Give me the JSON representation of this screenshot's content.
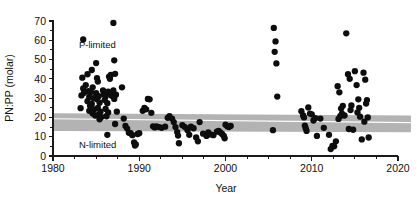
{
  "chart_data": {
    "type": "scatter",
    "title": "",
    "xlabel": "Year",
    "ylabel": "PN:PP (molar)",
    "xlim": [
      1980,
      2020
    ],
    "ylim": [
      0,
      70
    ],
    "xticks": [
      1980,
      1990,
      2000,
      2010,
      2020
    ],
    "yticks": [
      0,
      10,
      20,
      30,
      40,
      50,
      60,
      70
    ],
    "xtick_labels": [
      "1980",
      "1990",
      "2000",
      "2010",
      "2020"
    ],
    "ytick_labels": [
      "0",
      "10",
      "20",
      "30",
      "40",
      "50",
      "60",
      "70"
    ],
    "x_minor_interval": 2.5,
    "y_minor_interval": 5,
    "grid": false,
    "legend": "none",
    "annotations": [
      {
        "text": "P-limited",
        "x": 1983.0,
        "y": 56.0,
        "name": "p-limited-label"
      },
      {
        "text": "N-limited",
        "x": 1983.0,
        "y": 4.0,
        "name": "n-limited-label"
      }
    ],
    "trend_band": {
      "name": "redfield-confidence-band",
      "color": "#b3b3b3",
      "line_color": "#ffffff",
      "x_start": 1980.0,
      "x_end": 2021.5,
      "upper_start": 22.2,
      "upper_end": 21.0,
      "lower_start": 12.9,
      "lower_end": 12.3,
      "line_start": 19.3,
      "line_end": 17.3
    },
    "series": [
      {
        "name": "PN:PP observations",
        "marker": "filled-circle",
        "color": "#0d0d0d",
        "marker_size": 4.3,
        "points": [
          [
            1983.5,
            60.4
          ],
          [
            1983.4,
            40.6
          ],
          [
            1983.5,
            35.0
          ],
          [
            1983.6,
            32.8
          ],
          [
            1983.3,
            31.4
          ],
          [
            1983.2,
            24.8
          ],
          [
            1983.8,
            36.8
          ],
          [
            1984.0,
            42.4
          ],
          [
            1984.1,
            33.6
          ],
          [
            1984.2,
            30.6
          ],
          [
            1984.0,
            28.4
          ],
          [
            1984.3,
            26.0
          ],
          [
            1984.2,
            23.4
          ],
          [
            1984.5,
            44.6
          ],
          [
            1984.6,
            35.6
          ],
          [
            1984.4,
            33.2
          ],
          [
            1984.7,
            30.0
          ],
          [
            1984.5,
            27.0
          ],
          [
            1984.8,
            24.2
          ],
          [
            1984.6,
            22.0
          ],
          [
            1984.9,
            21.0
          ],
          [
            1985.0,
            48.2
          ],
          [
            1985.1,
            40.4
          ],
          [
            1985.2,
            38.6
          ],
          [
            1985.0,
            32.6
          ],
          [
            1985.3,
            31.0
          ],
          [
            1985.1,
            29.4
          ],
          [
            1985.4,
            27.6
          ],
          [
            1985.2,
            25.0
          ],
          [
            1985.5,
            23.0
          ],
          [
            1985.3,
            21.4
          ],
          [
            1985.6,
            20.2
          ],
          [
            1985.4,
            19.0
          ],
          [
            1985.8,
            34.0
          ],
          [
            1985.9,
            32.2
          ],
          [
            1986.0,
            31.6
          ],
          [
            1986.1,
            30.8
          ],
          [
            1986.2,
            32.0
          ],
          [
            1986.0,
            29.0
          ],
          [
            1986.3,
            27.4
          ],
          [
            1986.1,
            24.4
          ],
          [
            1986.4,
            22.6
          ],
          [
            1986.2,
            20.6
          ],
          [
            1986.5,
            41.2
          ],
          [
            1986.6,
            40.0
          ],
          [
            1986.7,
            42.0
          ],
          [
            1986.4,
            33.4
          ],
          [
            1986.8,
            31.2
          ],
          [
            1986.3,
            11.0
          ],
          [
            1987.0,
            69.0
          ],
          [
            1987.1,
            49.6
          ],
          [
            1987.2,
            42.6
          ],
          [
            1987.0,
            34.0
          ],
          [
            1987.3,
            31.8
          ],
          [
            1987.1,
            29.6
          ],
          [
            1987.4,
            23.0
          ],
          [
            1987.2,
            16.6
          ],
          [
            1988.0,
            35.6
          ],
          [
            1988.2,
            19.4
          ],
          [
            1988.4,
            15.6
          ],
          [
            1988.6,
            14.2
          ],
          [
            1988.8,
            12.0
          ],
          [
            1989.0,
            11.8
          ],
          [
            1989.2,
            10.8
          ],
          [
            1989.4,
            7.0
          ],
          [
            1989.5,
            5.4
          ],
          [
            1989.6,
            6.0
          ],
          [
            1989.8,
            11.4
          ],
          [
            1990.0,
            11.8
          ],
          [
            1990.4,
            23.4
          ],
          [
            1990.6,
            25.0
          ],
          [
            1990.8,
            24.2
          ],
          [
            1991.0,
            29.6
          ],
          [
            1991.2,
            29.4
          ],
          [
            1991.4,
            22.4
          ],
          [
            1991.6,
            15.4
          ],
          [
            1991.8,
            14.8
          ],
          [
            1992.0,
            15.4
          ],
          [
            1992.3,
            15.0
          ],
          [
            1992.6,
            14.6
          ],
          [
            1993.0,
            15.2
          ],
          [
            1993.3,
            19.8
          ],
          [
            1993.5,
            20.6
          ],
          [
            1993.8,
            19.4
          ],
          [
            1994.0,
            17.6
          ],
          [
            1994.2,
            15.0
          ],
          [
            1994.4,
            12.4
          ],
          [
            1994.5,
            10.6
          ],
          [
            1994.6,
            6.6
          ],
          [
            1995.0,
            16.0
          ],
          [
            1995.3,
            15.0
          ],
          [
            1995.6,
            13.4
          ],
          [
            1995.8,
            11.0
          ],
          [
            1996.0,
            15.2
          ],
          [
            1996.3,
            14.4
          ],
          [
            1996.6,
            9.6
          ],
          [
            1996.8,
            7.6
          ],
          [
            1997.0,
            17.6
          ],
          [
            1997.4,
            11.6
          ],
          [
            1997.8,
            10.4
          ],
          [
            1998.0,
            12.2
          ],
          [
            1998.3,
            11.2
          ],
          [
            1998.6,
            10.8
          ],
          [
            1999.0,
            12.6
          ],
          [
            1999.2,
            13.0
          ],
          [
            1999.4,
            12.2
          ],
          [
            1999.6,
            11.4
          ],
          [
            1999.8,
            10.4
          ],
          [
            1999.9,
            9.2
          ],
          [
            2000.0,
            16.2
          ],
          [
            2000.2,
            15.4
          ],
          [
            2000.4,
            15.0
          ],
          [
            2000.6,
            15.6
          ],
          [
            2005.6,
            66.4
          ],
          [
            2005.8,
            59.4
          ],
          [
            2005.7,
            54.0
          ],
          [
            2005.9,
            48.0
          ],
          [
            2006.0,
            30.8
          ],
          [
            2005.5,
            13.4
          ],
          [
            2008.8,
            23.2
          ],
          [
            2009.0,
            21.0
          ],
          [
            2009.1,
            20.0
          ],
          [
            2009.2,
            15.8
          ],
          [
            2009.3,
            14.4
          ],
          [
            2009.4,
            13.0
          ],
          [
            2009.6,
            25.2
          ],
          [
            2009.8,
            22.0
          ],
          [
            2010.0,
            21.6
          ],
          [
            2010.2,
            18.4
          ],
          [
            2010.4,
            19.6
          ],
          [
            2010.6,
            10.4
          ],
          [
            2011.0,
            19.4
          ],
          [
            2011.4,
            14.6
          ],
          [
            2012.0,
            11.0
          ],
          [
            2012.2,
            3.6
          ],
          [
            2012.4,
            5.2
          ],
          [
            2012.6,
            5.0
          ],
          [
            2012.8,
            7.6
          ],
          [
            2013.0,
            36.2
          ],
          [
            2013.2,
            33.0
          ],
          [
            2013.4,
            24.6
          ],
          [
            2013.6,
            26.0
          ],
          [
            2013.5,
            22.0
          ],
          [
            2013.3,
            20.6
          ],
          [
            2013.1,
            19.2
          ],
          [
            2013.8,
            21.0
          ],
          [
            2014.0,
            63.6
          ],
          [
            2014.2,
            42.4
          ],
          [
            2014.4,
            40.0
          ],
          [
            2014.6,
            26.2
          ],
          [
            2014.5,
            23.8
          ],
          [
            2014.3,
            14.0
          ],
          [
            2014.8,
            13.6
          ],
          [
            2015.0,
            44.0
          ],
          [
            2015.2,
            36.8
          ],
          [
            2015.4,
            29.4
          ],
          [
            2015.5,
            25.0
          ],
          [
            2015.3,
            22.6
          ],
          [
            2015.6,
            20.4
          ],
          [
            2015.8,
            8.6
          ],
          [
            2016.0,
            43.2
          ],
          [
            2016.2,
            39.6
          ],
          [
            2016.4,
            29.0
          ],
          [
            2016.3,
            27.2
          ],
          [
            2016.5,
            20.0
          ],
          [
            2016.6,
            9.6
          ],
          [
            2016.1,
            17.8
          ]
        ]
      }
    ]
  }
}
